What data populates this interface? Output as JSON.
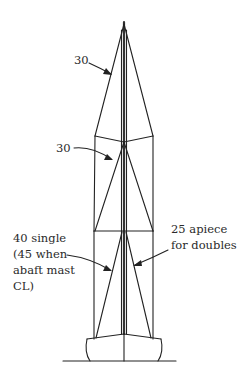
{
  "diagram": {
    "type": "sailboat rig shroud/stay diagram (front view)",
    "colors": {
      "line": "#222222",
      "text": "#2a2a2a",
      "background": "#ffffff"
    },
    "labels": {
      "top_cap_shroud": "30",
      "intermediate_shroud": "30",
      "lower_single_line1": "40 single",
      "lower_single_line2": "(45 when",
      "lower_single_line3": "abaft mast",
      "lower_single_line4": "CL)",
      "lower_double_line1": "25 apiece",
      "lower_double_line2": "for doubles"
    }
  }
}
